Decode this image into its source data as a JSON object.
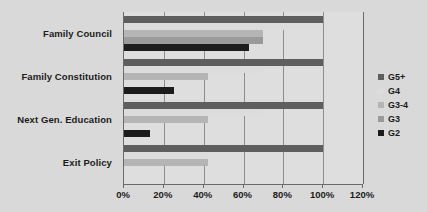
{
  "chart_data": {
    "type": "bar",
    "orientation": "horizontal",
    "title": "",
    "xlabel": "",
    "ylabel": "",
    "categories": [
      "Family Council",
      "Family Constitution",
      "Next Gen. Education",
      "Exit Policy"
    ],
    "series": [
      {
        "name": "G2",
        "color": "#1c1c1c",
        "values": [
          63,
          25,
          13,
          0
        ]
      },
      {
        "name": "G3",
        "color": "#9a9a9a",
        "values": [
          70,
          0,
          0,
          0
        ]
      },
      {
        "name": "G3-4",
        "color": "#b5b5b5",
        "values": [
          70,
          42,
          42,
          42
        ]
      },
      {
        "name": "G4",
        "color": "#dcdcdc",
        "values": [
          100,
          70,
          70,
          42
        ]
      },
      {
        "name": "G5+",
        "color": "#5e5e5e",
        "values": [
          100,
          100,
          100,
          100
        ]
      }
    ],
    "xlim": [
      0,
      120
    ],
    "x_ticks": [
      "0%",
      "20%",
      "40%",
      "60%",
      "80%",
      "100%",
      "120%"
    ],
    "x_tick_values": [
      0,
      20,
      40,
      60,
      80,
      100,
      120
    ],
    "grid": true,
    "legend_position": "right",
    "legend_entries": [
      "G5+",
      "G4",
      "G3-4",
      "G3",
      "G2"
    ],
    "value_unit": "%",
    "background_color": "#d9d9d9",
    "plot_background_color": "#dedede",
    "axis_color": "#6b6b6b",
    "gridline_color": "#8e8e8e"
  }
}
